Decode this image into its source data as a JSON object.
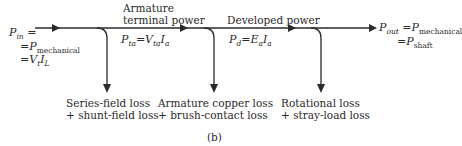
{
  "figure_label": "(b)",
  "input": {
    "symbol": "P",
    "subscript": "in",
    "line1_suffix": " =",
    "line2_prefix": "=P",
    "line2_subscript": "mechanical",
    "line3_prefix": "=V",
    "line3_sub1": "t",
    "line3_mid": "I",
    "line3_sub2": "L"
  },
  "stages": [
    {
      "heading_line1": "Armature",
      "heading_line2": "terminal power",
      "eq_lhs": "P",
      "eq_lhs_sub": "ta",
      "eq_rhs_a": "=V",
      "eq_rhs_a_sub": "ta",
      "eq_rhs_b": "I",
      "eq_rhs_b_sub": "a"
    },
    {
      "heading_line1": "Developed power",
      "eq_lhs": "P",
      "eq_lhs_sub": "d",
      "eq_rhs_a": "=E",
      "eq_rhs_a_sub": "a",
      "eq_rhs_b": "I",
      "eq_rhs_b_sub": "a"
    }
  ],
  "output": {
    "symbol": "P",
    "subscript": "out",
    "line1_rhs": " =P",
    "line1_rhs_sub": "mechanical",
    "line2_prefix": "=P",
    "line2_sub": "shaft"
  },
  "losses": [
    {
      "line1": "Series-field loss",
      "line2": "+ shunt-field loss"
    },
    {
      "line1": "Armature copper loss",
      "line2": "+ brush-contact loss"
    },
    {
      "line1": "Rotational loss",
      "line2": "+ stray-load loss"
    }
  ],
  "colors": {
    "line": "#2a2a2a",
    "text": "#2a2a2a",
    "background": "#ffffff"
  }
}
